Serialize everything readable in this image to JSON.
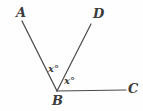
{
  "figure": {
    "type": "geometry-diagram",
    "background_color": "#fefefe",
    "stroke_color": "#4a4a4a",
    "label_color": "#3a3a3a"
  },
  "points": [
    {
      "id": "A",
      "label": "A",
      "x": 22,
      "y": 21
    },
    {
      "id": "D",
      "label": "D",
      "x": 91,
      "y": 24
    },
    {
      "id": "B",
      "label": "B",
      "x": 57,
      "y": 91
    },
    {
      "id": "C",
      "label": "C",
      "x": 126,
      "y": 90
    }
  ],
  "rays": [
    {
      "id": "BA",
      "from": "B",
      "to": "A",
      "x1": 57,
      "y1": 91,
      "x2": 22,
      "y2": 21
    },
    {
      "id": "BD",
      "from": "B",
      "to": "D",
      "x1": 57,
      "y1": 91,
      "x2": 91,
      "y2": 24
    },
    {
      "id": "BC",
      "from": "B",
      "to": "C",
      "x1": 57,
      "y1": 91,
      "x2": 126,
      "y2": 90
    }
  ],
  "angle_labels": [
    {
      "id": "angle-ABD",
      "text": "x°",
      "x": 48,
      "y": 64
    },
    {
      "id": "angle-DBC",
      "text": "x°",
      "x": 64,
      "y": 76
    }
  ]
}
